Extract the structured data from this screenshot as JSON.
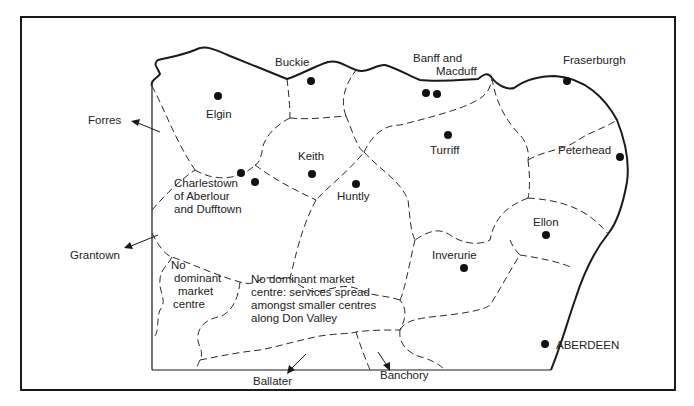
{
  "map": {
    "title": "Market centre service areas, North-East Scotland",
    "colors": {
      "ink": "#1a1a1a",
      "background": "#ffffff"
    },
    "towns": [
      {
        "name": "Elgin",
        "x": 218,
        "y": 96
      },
      {
        "name": "Buckie",
        "x": 311,
        "y": 81
      },
      {
        "name": "Banff",
        "x": 426,
        "y": 93
      },
      {
        "name": "Macduff",
        "x": 437,
        "y": 94
      },
      {
        "name": "Fraserburgh",
        "x": 567,
        "y": 81
      },
      {
        "name": "Keith",
        "x": 312,
        "y": 174
      },
      {
        "name": "Turriff",
        "x": 448,
        "y": 135
      },
      {
        "name": "Peterhead",
        "x": 620,
        "y": 157
      },
      {
        "name": "Charlestown of Aberlour",
        "x": 240,
        "y": 173
      },
      {
        "name": "Dufftown",
        "x": 255,
        "y": 182
      },
      {
        "name": "Huntly",
        "x": 355,
        "y": 184
      },
      {
        "name": "Ellon",
        "x": 546,
        "y": 235
      },
      {
        "name": "Inverurie",
        "x": 463,
        "y": 268
      },
      {
        "name": "ABERDEEN",
        "x": 545,
        "y": 344
      }
    ],
    "labels": {
      "elgin": "Elgin",
      "buckie": "Buckie",
      "banff_line1": "Banff and",
      "banff_line2": "Macduff",
      "fraserburgh": "Fraserburgh",
      "keith": "Keith",
      "turriff": "Turriff",
      "peterhead": "Peterhead",
      "charlestown_line1": "Charlestown",
      "charlestown_line2": "of Aberlour",
      "charlestown_line3": "and Dufftown",
      "huntly": "Huntly",
      "ellon": "Ellon",
      "inverurie": "Inverurie",
      "aberdeen": "ABERDEEN",
      "no_dominant_line1": "No",
      "no_dominant_line2": "dominant",
      "no_dominant_line3": "market",
      "no_dominant_line4": "centre",
      "don_valley_line1": "No dominant market",
      "don_valley_line2": "centre: services spread",
      "don_valley_line3": "amongst smaller centres",
      "don_valley_line4": "along Don Valley"
    },
    "external_destinations": {
      "forres": "Forres",
      "grantown": "Grantown",
      "ballater": "Ballater",
      "banchory": "Banchory"
    }
  }
}
